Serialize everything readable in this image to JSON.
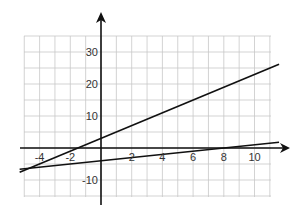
{
  "chart_data": {
    "type": "line",
    "title": "",
    "xlabel": "",
    "ylabel": "",
    "xlim": [
      -5,
      11.6
    ],
    "ylim": [
      -15,
      35
    ],
    "grid": true,
    "grid_step": {
      "x": 1,
      "y": 5
    },
    "x_ticks": [
      {
        "value": -4,
        "label": "-4"
      },
      {
        "value": -2,
        "label": "-2"
      },
      {
        "value": 2,
        "label": "2"
      },
      {
        "value": 4,
        "label": "4"
      },
      {
        "value": 6,
        "label": "6"
      },
      {
        "value": 8,
        "label": "8"
      },
      {
        "value": 10,
        "label": "10"
      }
    ],
    "y_ticks": [
      {
        "value": 30,
        "label": "30"
      },
      {
        "value": 20,
        "label": "20"
      },
      {
        "value": 10,
        "label": "10"
      },
      {
        "value": -10,
        "label": "-10"
      }
    ],
    "series": [
      {
        "name": "line-1",
        "equation": "y = 2x + 3",
        "x": [
          -5.3,
          11.6
        ],
        "y": [
          -7.6,
          26.2
        ]
      },
      {
        "name": "line-2",
        "equation": "y = 0.5x - 4",
        "x": [
          -5.3,
          11.6
        ],
        "y": [
          -6.65,
          1.8
        ]
      }
    ],
    "legend": null
  }
}
